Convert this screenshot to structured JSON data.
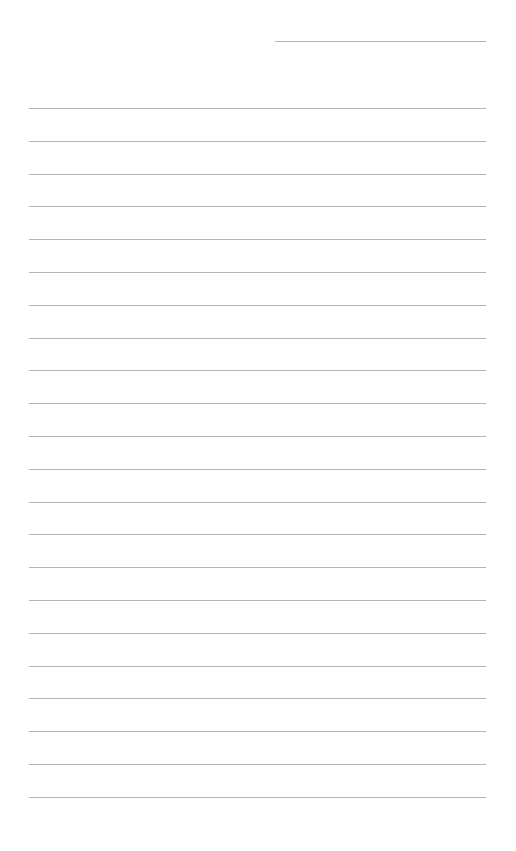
{
  "page": {
    "type": "lined-paper",
    "background_color": "#ffffff",
    "line_color": "#b4b4b4",
    "header_line": {
      "present": true
    },
    "ruled_lines": {
      "count": 22,
      "first_y": 108,
      "spacing": 32.8
    }
  }
}
